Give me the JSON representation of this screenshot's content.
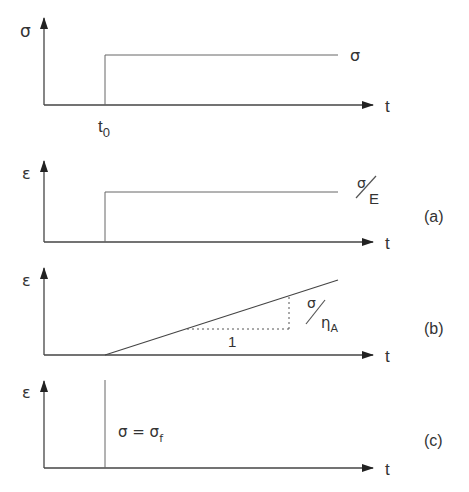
{
  "figure": {
    "colors": {
      "line": "#555555",
      "axis": "#444444",
      "text": "#333333"
    }
  },
  "panels": [
    {
      "id": "stress",
      "y_label": "σ",
      "x_label": "t",
      "curve_label": "σ",
      "tick_label_main": "t",
      "tick_label_sub": "0"
    },
    {
      "id": "a",
      "y_label": "ε",
      "x_label": "t",
      "curve_label_num": "σ",
      "curve_label_den": "E",
      "panel_label": "(a)"
    },
    {
      "id": "b",
      "y_label": "ε",
      "x_label": "t",
      "curve_label_num": "σ",
      "curve_label_den_main": "η",
      "curve_label_den_sub": "A",
      "slope_run_label": "1",
      "panel_label": "(b)"
    },
    {
      "id": "c",
      "y_label": "ε",
      "x_label": "t",
      "annotation_main": "σ = σ",
      "annotation_sub": "f",
      "panel_label": "(c)"
    }
  ]
}
